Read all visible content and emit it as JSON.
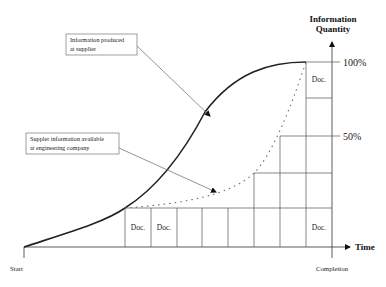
{
  "diagram": {
    "axes": {
      "y_title_line1": "Information",
      "y_title_line2": "Quantity",
      "x_title": "Time",
      "x_start_label": "Start",
      "x_end_label": "Completion",
      "y_tick_100": "100%",
      "y_tick_50": "50%"
    },
    "callouts": {
      "produced": {
        "line1": "Information produced",
        "line2": "at supplier"
      },
      "available": {
        "line1": "Suppler information available",
        "line2": "at engineering company"
      }
    },
    "documents": {
      "doc_label": "Doc.",
      "bottom_row": [
        "Doc.",
        "Doc.",
        "",
        "",
        "",
        "",
        "",
        "Doc."
      ],
      "top_cell": "Doc."
    },
    "curves": [
      {
        "name": "Information produced at supplier",
        "style": "solid"
      },
      {
        "name": "Suppler information available at engineering company",
        "style": "dotted"
      }
    ]
  }
}
